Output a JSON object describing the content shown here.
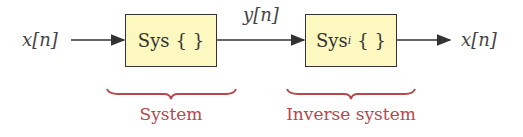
{
  "diagram": {
    "type": "block-diagram",
    "input_label": "x[n]",
    "intermediate_label": "y[n]",
    "output_label": "x[n]",
    "blocks": [
      {
        "id": "system",
        "label": "Sys",
        "subscript": "",
        "braces": "{ }",
        "caption": "System"
      },
      {
        "id": "inverse",
        "label": "Sys",
        "subscript": "i",
        "braces": "{ }",
        "caption": "Inverse system"
      }
    ],
    "colors": {
      "block_fill": "#fdf8c0",
      "block_border": "#333333",
      "caption": "#b5474d",
      "brace": "#b5474d",
      "arrow": "#333333"
    }
  }
}
